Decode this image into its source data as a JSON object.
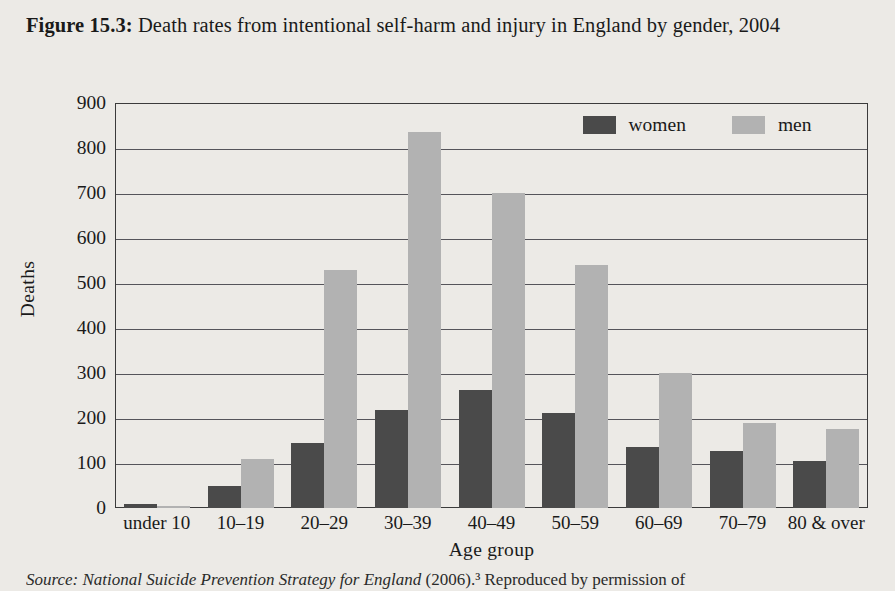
{
  "figure": {
    "label": "Figure 15.3:",
    "caption": " Death rates from intentional self-harm and injury in England by gender, 2004"
  },
  "source_note": {
    "label": "Source: ",
    "title": "National Suicide Prevention Strategy for England",
    "rest": " (2006).³ Reproduced by permission of"
  },
  "colors": {
    "women": "#4a4a4a",
    "men": "#b2b2b2",
    "axis": "#3b3b3b",
    "gridline": "#55545a",
    "background": "#eceae6"
  },
  "chart_data": {
    "type": "bar",
    "title": "Death rates from intentional self-harm and injury in England by gender, 2004",
    "xlabel": "Age group",
    "ylabel": "Deaths",
    "ylim": [
      0,
      900
    ],
    "yticks": [
      0,
      100,
      200,
      300,
      400,
      500,
      600,
      700,
      800,
      900
    ],
    "grid": true,
    "legend_position": "top-right",
    "categories": [
      "under 10",
      "10–19",
      "20–29",
      "30–39",
      "40–49",
      "50–59",
      "60–69",
      "70–79",
      "80 & over"
    ],
    "series": [
      {
        "name": "women",
        "color": "#4a4a4a",
        "values": [
          8,
          50,
          145,
          218,
          262,
          212,
          135,
          127,
          105
        ]
      },
      {
        "name": "men",
        "color": "#b2b2b2",
        "values": [
          5,
          110,
          530,
          835,
          700,
          540,
          300,
          188,
          175
        ]
      }
    ]
  }
}
